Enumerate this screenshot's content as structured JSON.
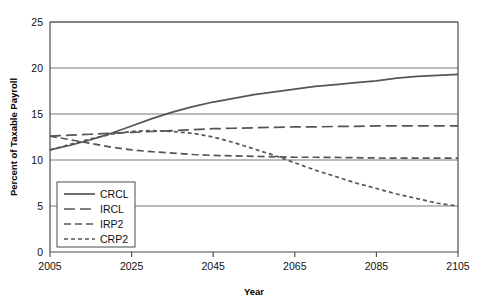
{
  "chart_data": {
    "type": "line",
    "title": "",
    "xlabel": "Year",
    "ylabel": "Percent of Taxable Payroll",
    "xlim": [
      2005,
      2105
    ],
    "ylim": [
      0,
      25
    ],
    "xticks": [
      2005,
      2025,
      2045,
      2065,
      2085,
      2105
    ],
    "xtick_labels": [
      "2005",
      "2025",
      "2045",
      "2065",
      "2085",
      "2105"
    ],
    "yticks": [
      0,
      5,
      10,
      15,
      20,
      25
    ],
    "ytick_labels": [
      "0",
      "5",
      "10",
      "15",
      "20",
      "25"
    ],
    "grid": "horizontal",
    "legend_position": "lower-left-inside",
    "x": [
      2005,
      2010,
      2015,
      2020,
      2025,
      2030,
      2035,
      2040,
      2045,
      2050,
      2055,
      2060,
      2065,
      2070,
      2075,
      2080,
      2085,
      2090,
      2095,
      2100,
      2105
    ],
    "series": [
      {
        "name": "CRCL",
        "style": "solid",
        "color": "#555555",
        "values": [
          11.1,
          11.6,
          12.2,
          12.9,
          13.7,
          14.5,
          15.2,
          15.8,
          16.3,
          16.7,
          17.1,
          17.4,
          17.7,
          18.0,
          18.2,
          18.4,
          18.6,
          18.9,
          19.1,
          19.2,
          19.3
        ]
      },
      {
        "name": "IRCL",
        "style": "long-dash",
        "color": "#555555",
        "values": [
          12.6,
          12.7,
          12.8,
          12.9,
          13.0,
          13.1,
          13.2,
          13.3,
          13.4,
          13.45,
          13.5,
          13.55,
          13.6,
          13.6,
          13.65,
          13.65,
          13.7,
          13.7,
          13.7,
          13.7,
          13.7
        ]
      },
      {
        "name": "IRP2",
        "style": "dash",
        "color": "#555555",
        "values": [
          12.6,
          12.2,
          11.8,
          11.4,
          11.1,
          10.9,
          10.75,
          10.6,
          10.5,
          10.45,
          10.4,
          10.35,
          10.3,
          10.3,
          10.28,
          10.25,
          10.22,
          10.2,
          10.2,
          10.2,
          10.2
        ]
      },
      {
        "name": "CRP2",
        "style": "short-dash",
        "color": "#555555",
        "values": [
          11.1,
          11.7,
          12.3,
          12.8,
          13.1,
          13.2,
          13.1,
          12.9,
          12.5,
          11.9,
          11.2,
          10.5,
          9.7,
          8.9,
          8.2,
          7.5,
          6.9,
          6.3,
          5.8,
          5.3,
          5.0
        ]
      }
    ]
  },
  "legend": {
    "items": [
      {
        "label": "CRCL",
        "style": "solid"
      },
      {
        "label": "IRCL",
        "style": "long-dash"
      },
      {
        "label": "IRP2",
        "style": "dash"
      },
      {
        "label": "CRP2",
        "style": "short-dash"
      }
    ]
  },
  "colors": {
    "line": "#555555",
    "axis": "#4a4a4a",
    "grid": "#6a6a6a",
    "background": "#ffffff",
    "text": "#111111"
  }
}
